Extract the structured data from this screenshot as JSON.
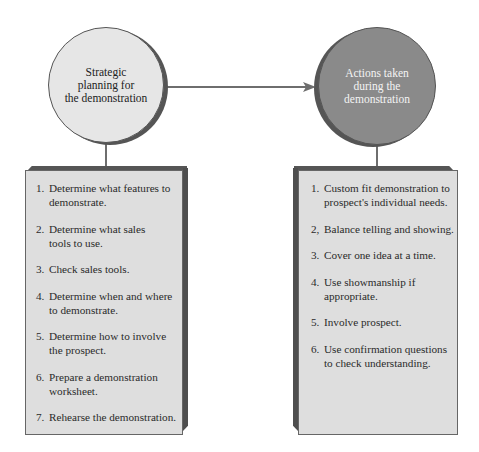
{
  "diagram": {
    "left_node": {
      "label": "Strategic planning for the demonstration",
      "lines": [
        "Strategic",
        "planning for",
        "the demonstration"
      ],
      "fill": "#e6e6e6"
    },
    "right_node": {
      "label": "Actions taken during the demonstration",
      "lines": [
        "Actions taken",
        "during the",
        "demonstration"
      ],
      "fill": "#8a8a8a"
    },
    "arrow": {
      "from": "left_node",
      "to": "right_node",
      "color": "#6e6e6e"
    },
    "left_list": {
      "items": [
        {
          "num": "1.",
          "text": "Determine what features to demonstrate."
        },
        {
          "num": "2.",
          "text": "Determine what sales tools to use."
        },
        {
          "num": "3.",
          "text": "Check sales tools."
        },
        {
          "num": "4.",
          "text": "Determine when and where to demonstrate."
        },
        {
          "num": "5.",
          "text": "Determine how to involve the prospect."
        },
        {
          "num": "6.",
          "text": "Prepare a demonstration worksheet."
        },
        {
          "num": "7.",
          "text": "Rehearse the demonstration."
        }
      ]
    },
    "right_list": {
      "items": [
        {
          "num": "1.",
          "text": "Custom fit demonstration to prospect's individual needs."
        },
        {
          "num": "2,",
          "text": "Balance telling and showing."
        },
        {
          "num": "3.",
          "text": "Cover one idea at a time."
        },
        {
          "num": "4.",
          "text": "Use showmanship if appropriate."
        },
        {
          "num": "5.",
          "text": "Involve prospect."
        },
        {
          "num": "6.",
          "text": "Use confirmation questions to check understanding."
        }
      ]
    }
  }
}
